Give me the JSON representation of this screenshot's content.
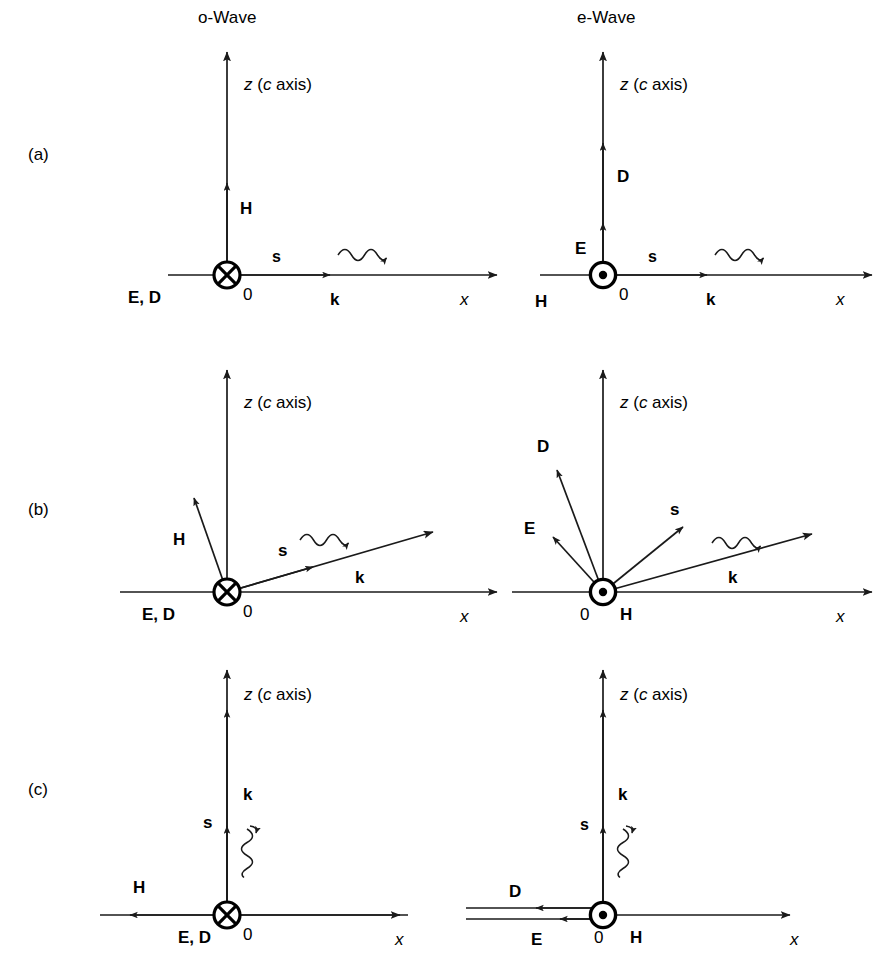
{
  "figure": {
    "title_columns": [
      {
        "id": "o-wave",
        "label": "o-Wave"
      },
      {
        "id": "e-wave",
        "label": "e-Wave"
      }
    ],
    "row_labels": [
      {
        "id": "a",
        "label": "(a)"
      },
      {
        "id": "b",
        "label": "(b)"
      },
      {
        "id": "c",
        "label": "(c)"
      }
    ],
    "axis_labels": {
      "z": "z",
      "z_paren_open": "(",
      "z_c": "c",
      "z_axis_word": " axis)",
      "z_full": "z (c axis)",
      "x": "x",
      "origin": "0"
    },
    "vector_labels": {
      "E": "E",
      "D": "D",
      "H": "H",
      "k": "k",
      "s": "s",
      "ED": "E, D"
    },
    "colors": {
      "line": "#1a1a1a",
      "text": "#000000",
      "background": "#ffffff"
    },
    "panels": [
      {
        "id": "a-o-wave",
        "row": "(a)",
        "column": "o-Wave",
        "origin_marker": "circle-cross",
        "vectors": [
          {
            "name": "z",
            "label": "z (c axis)",
            "direction": "up"
          },
          {
            "name": "x",
            "label": "x",
            "direction": "right"
          },
          {
            "name": "H",
            "label": "H",
            "direction": "up"
          },
          {
            "name": "k",
            "label": "k",
            "direction": "right"
          },
          {
            "name": "s",
            "label": "s",
            "direction": "right"
          },
          {
            "name": "ED",
            "label": "E, D",
            "direction": "into-page"
          }
        ]
      },
      {
        "id": "a-e-wave",
        "row": "(a)",
        "column": "e-Wave",
        "origin_marker": "circle-dot",
        "vectors": [
          {
            "name": "z",
            "label": "z (c axis)",
            "direction": "up"
          },
          {
            "name": "x",
            "label": "x",
            "direction": "right"
          },
          {
            "name": "D",
            "label": "D",
            "direction": "up"
          },
          {
            "name": "E",
            "label": "E",
            "direction": "up"
          },
          {
            "name": "k",
            "label": "k",
            "direction": "right"
          },
          {
            "name": "s",
            "label": "s",
            "direction": "right"
          },
          {
            "name": "H",
            "label": "H",
            "direction": "out-of-page"
          }
        ]
      },
      {
        "id": "b-o-wave",
        "row": "(b)",
        "column": "o-Wave",
        "origin_marker": "circle-cross",
        "vectors": [
          {
            "name": "z",
            "label": "z (c axis)",
            "direction": "up"
          },
          {
            "name": "x",
            "label": "x",
            "direction": "right"
          },
          {
            "name": "H",
            "label": "H",
            "direction": "up-left-oblique"
          },
          {
            "name": "k",
            "label": "k",
            "direction": "up-right-oblique"
          },
          {
            "name": "s",
            "label": "s",
            "direction": "up-right-oblique"
          },
          {
            "name": "ED",
            "label": "E, D",
            "direction": "into-page"
          }
        ]
      },
      {
        "id": "b-e-wave",
        "row": "(b)",
        "column": "e-Wave",
        "origin_marker": "circle-dot",
        "vectors": [
          {
            "name": "z",
            "label": "z (c axis)",
            "direction": "up"
          },
          {
            "name": "x",
            "label": "x",
            "direction": "right"
          },
          {
            "name": "D",
            "label": "D",
            "direction": "up-left-oblique"
          },
          {
            "name": "E",
            "label": "E",
            "direction": "up-left-oblique-shallow"
          },
          {
            "name": "s",
            "label": "s",
            "direction": "up-right-oblique"
          },
          {
            "name": "k",
            "label": "k",
            "direction": "up-right-oblique-shallow"
          },
          {
            "name": "H",
            "label": "H",
            "direction": "out-of-page"
          }
        ]
      },
      {
        "id": "c-o-wave",
        "row": "(c)",
        "column": "o-Wave",
        "origin_marker": "circle-cross",
        "vectors": [
          {
            "name": "z",
            "label": "z (c axis)",
            "direction": "up"
          },
          {
            "name": "x",
            "label": "x",
            "direction": "right"
          },
          {
            "name": "k",
            "label": "k",
            "direction": "up"
          },
          {
            "name": "s",
            "label": "s",
            "direction": "up"
          },
          {
            "name": "H",
            "label": "H",
            "direction": "left"
          },
          {
            "name": "ED",
            "label": "E, D",
            "direction": "into-page"
          }
        ]
      },
      {
        "id": "c-e-wave",
        "row": "(c)",
        "column": "e-Wave",
        "origin_marker": "circle-dot",
        "vectors": [
          {
            "name": "z",
            "label": "z (c axis)",
            "direction": "up"
          },
          {
            "name": "x",
            "label": "x",
            "direction": "right"
          },
          {
            "name": "k",
            "label": "k",
            "direction": "up"
          },
          {
            "name": "s",
            "label": "s",
            "direction": "up"
          },
          {
            "name": "D",
            "label": "D",
            "direction": "left"
          },
          {
            "name": "E",
            "label": "E",
            "direction": "left"
          },
          {
            "name": "H",
            "label": "H",
            "direction": "out-of-page"
          }
        ]
      }
    ]
  }
}
